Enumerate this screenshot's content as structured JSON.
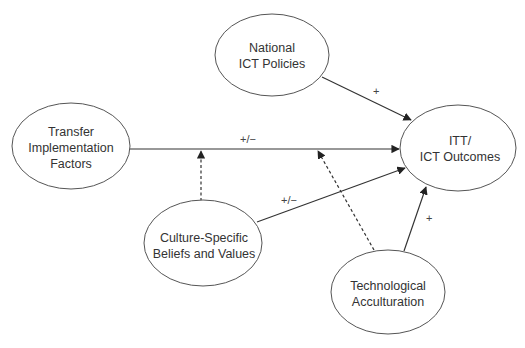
{
  "diagram": {
    "nodes": {
      "national": {
        "line1": "National",
        "line2": "ICT Policies"
      },
      "transfer": {
        "line1": "Transfer",
        "line2": "Implementation",
        "line3": "Factors"
      },
      "outcomes": {
        "line1": "ITT/",
        "line2": "ICT Outcomes"
      },
      "culture": {
        "line1": "Culture-Specific",
        "line2": "Beliefs and Values"
      },
      "technological": {
        "line1": "Technological",
        "line2": "Acculturation"
      }
    },
    "edges": {
      "national_to_outcomes": {
        "label": "+",
        "style": "solid"
      },
      "transfer_to_outcomes": {
        "label": "+/−",
        "style": "solid"
      },
      "culture_to_outcomes": {
        "label": "+/−",
        "style": "solid"
      },
      "technological_to_outcomes": {
        "label": "+",
        "style": "solid"
      },
      "culture_moderates_transfer": {
        "label": "",
        "style": "dashed"
      },
      "technological_moderates_transfer": {
        "label": "",
        "style": "dashed"
      }
    }
  }
}
